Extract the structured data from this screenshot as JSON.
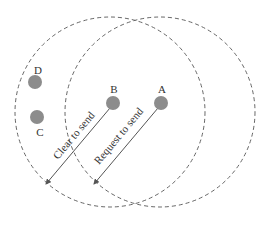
{
  "diagram": {
    "type": "hidden-terminal-rts-cts",
    "colors": {
      "node_fill": "#8c8c8c",
      "circle_stroke": "#666666",
      "arrow": "#555555",
      "text": "#333333"
    },
    "ranges": [
      {
        "id": "range-B",
        "cx": 110,
        "cy": 112,
        "r": 95
      },
      {
        "id": "range-A",
        "cx": 160,
        "cy": 112,
        "r": 95
      }
    ],
    "nodes": [
      {
        "id": "D",
        "label": "D",
        "cx": 35,
        "cy": 82,
        "label_x": 38,
        "label_y": 72
      },
      {
        "id": "C",
        "label": "C",
        "cx": 37,
        "cy": 117,
        "label_x": 40,
        "label_y": 136
      },
      {
        "id": "B",
        "label": "B",
        "cx": 113,
        "cy": 103,
        "label_x": 114,
        "label_y": 93
      },
      {
        "id": "A",
        "label": "A",
        "cx": 161,
        "cy": 103,
        "label_x": 162,
        "label_y": 93
      }
    ],
    "arrows": [
      {
        "id": "cts",
        "label": "Clear to send",
        "x1": 110,
        "y1": 108,
        "x2": 46,
        "y2": 184
      },
      {
        "id": "rts",
        "label": "Request to send",
        "x1": 158,
        "y1": 108,
        "x2": 94,
        "y2": 184
      }
    ]
  }
}
